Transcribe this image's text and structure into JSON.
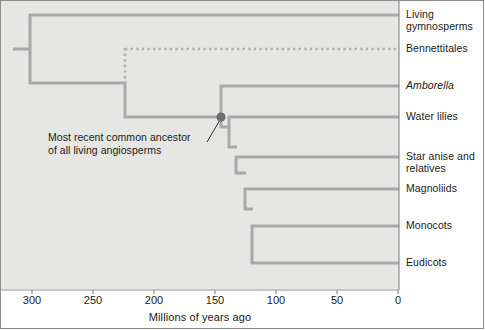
{
  "figure": {
    "type": "phylogenetic-tree-cladogram",
    "background_color": "#e6e6e4",
    "branch_color": "#a8a8a8",
    "node_color": "#6e6e6e",
    "axis_color": "#8d8d8d",
    "text_color": "#1b1b1b"
  },
  "axis": {
    "title": "Millions of years ago",
    "direction": "reversed",
    "min": 0,
    "max": 330,
    "ticks": [
      {
        "value": 300,
        "label": "300",
        "x": 32
      },
      {
        "value": 250,
        "label": "250",
        "x": 93
      },
      {
        "value": 200,
        "label": "200",
        "x": 154
      },
      {
        "value": 150,
        "label": "150",
        "x": 215
      },
      {
        "value": 100,
        "label": "100",
        "x": 276
      },
      {
        "value": 50,
        "label": "50",
        "x": 337
      },
      {
        "value": 0,
        "label": "0",
        "x": 398
      }
    ]
  },
  "annotation": {
    "text": "Most recent common ancestor\nof all living angiosperms",
    "points_to_node": "angiosperm-crown-node",
    "leader_from": {
      "x": 208,
      "y": 141
    },
    "leader_to": {
      "x": 221,
      "y": 119
    }
  },
  "taxa": [
    {
      "id": "living-gymnosperms",
      "label": "Living\ngymnosperms",
      "italic": false,
      "y": 15,
      "branch_start_myr": 300,
      "branch_style": "solid",
      "label_top": 8
    },
    {
      "id": "bennettitales",
      "label": "Bennettitales",
      "italic": false,
      "y": 49,
      "branch_start_myr": 225,
      "branch_style": "dotted",
      "label_top": 42
    },
    {
      "id": "amborella",
      "label": "Amborella",
      "italic": true,
      "y": 86,
      "branch_start_myr": 150,
      "branch_style": "solid",
      "label_top": 79
    },
    {
      "id": "water-lilies",
      "label": "Water lilies",
      "italic": false,
      "y": 117,
      "branch_start_myr": 146,
      "branch_style": "solid",
      "label_top": 110
    },
    {
      "id": "star-anise-and-relatives",
      "label": "Star anise and\nrelatives",
      "italic": false,
      "y": 157,
      "branch_start_myr": 140,
      "branch_style": "solid",
      "label_top": 150
    },
    {
      "id": "magnoliids",
      "label": "Magnoliids",
      "italic": false,
      "y": 189,
      "branch_start_myr": 132,
      "branch_style": "solid",
      "label_top": 182
    },
    {
      "id": "monocots",
      "label": "Monocots",
      "italic": false,
      "y": 226,
      "branch_start_myr": 127,
      "branch_style": "solid",
      "label_top": 219
    },
    {
      "id": "eudicots",
      "label": "Eudicots",
      "italic": false,
      "y": 263,
      "branch_start_myr": 123,
      "branch_style": "solid",
      "label_top": 256
    }
  ],
  "nodes": [
    {
      "id": "root",
      "x": 30,
      "myr": 302,
      "y_top": 15,
      "y_bottom": 83
    },
    {
      "id": "seed-plant-split",
      "x": 30,
      "myr": 302
    },
    {
      "id": "angiosperm-stem-step",
      "x": 125,
      "myr": 225,
      "y_top": 83,
      "y_bottom": 117
    },
    {
      "id": "angiosperm-crown-node",
      "x": 221,
      "myr": 150,
      "y_top": 86,
      "y_bottom": 127,
      "marker": true,
      "marker_radius": 4.5
    },
    {
      "id": "node-after-amborella",
      "x": 229,
      "myr": 143,
      "y_top": 117,
      "y_bottom": 147
    },
    {
      "id": "node-after-waterlilies",
      "x": 236,
      "myr": 138,
      "y_top": 157,
      "y_bottom": 173
    },
    {
      "id": "node-mesangiosperms",
      "x": 245,
      "myr": 130,
      "y_top": 189,
      "y_bottom": 209
    },
    {
      "id": "node-monocots-eudicots",
      "x": 252,
      "myr": 125,
      "y_top": 226,
      "y_bottom": 263
    }
  ],
  "tip_x": 398
}
